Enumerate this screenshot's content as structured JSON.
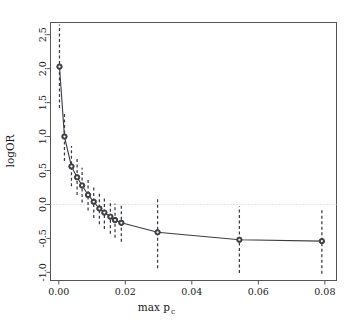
{
  "chart_data": {
    "type": "line",
    "title": "",
    "subtitle": "",
    "xlabel": "max p",
    "xlabel_sub": "c",
    "ylabel": "logOR",
    "xlim": [
      -0.0025,
      0.0835
    ],
    "ylim": [
      -1.12,
      2.68
    ],
    "grid": false,
    "legend": null,
    "reference_lines": [
      {
        "name": "zero-line",
        "axis": "y",
        "value": 0.0,
        "style": "dotted",
        "color": "#c8c8c8"
      }
    ],
    "x": [
      0.0002,
      0.0017,
      0.0038,
      0.0055,
      0.007,
      0.0088,
      0.0105,
      0.0122,
      0.0137,
      0.0155,
      0.0169,
      0.0188,
      0.0297,
      0.0543,
      0.0791
    ],
    "xtick_values": [
      0.0,
      0.02,
      0.04,
      0.06,
      0.08
    ],
    "xtick_labels": [
      "0.00",
      "0.02",
      "0.04",
      "0.06",
      "0.08"
    ],
    "ytick_values": [
      -1.0,
      -0.5,
      0.0,
      0.5,
      1.0,
      1.5,
      2.0,
      2.5
    ],
    "ytick_labels": [
      "-1.0",
      "-0.5",
      "0.0",
      "0.5",
      "1.0",
      "1.5",
      "2.0",
      "2.5"
    ],
    "series": [
      {
        "name": "logOR",
        "point_color": "#404048",
        "line_color": "#3c3c46",
        "errorbar_color": "#3c3c46",
        "errorbar_style": "dashed",
        "values": [
          2.03,
          1.0,
          0.56,
          0.4,
          0.28,
          0.14,
          0.04,
          -0.06,
          -0.12,
          -0.18,
          -0.23,
          -0.27,
          -0.41,
          -0.52,
          -0.54
        ],
        "err_low": [
          1.42,
          0.64,
          0.27,
          0.14,
          0.03,
          -0.09,
          -0.2,
          -0.29,
          -0.36,
          -0.43,
          -0.49,
          -0.55,
          -0.94,
          -1.01,
          -1.02
        ],
        "err_high": [
          2.65,
          1.37,
          0.86,
          0.67,
          0.54,
          0.39,
          0.28,
          0.18,
          0.12,
          0.06,
          0.01,
          -0.02,
          0.08,
          -0.03,
          -0.06
        ]
      }
    ]
  },
  "axes": {
    "x_title_main": "max p",
    "x_title_sub": "c",
    "y_title": "logOR"
  }
}
